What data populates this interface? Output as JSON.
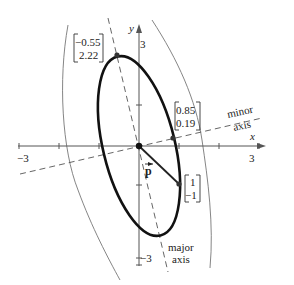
{
  "figure": {
    "type": "diagram",
    "axes": {
      "x_label": "x",
      "y_label": "y",
      "x_tick_min_label": "−3",
      "x_tick_max_label": "3",
      "y_tick_max_label": "3",
      "y_tick_min_label": "−3",
      "x_range": [
        -3,
        3
      ],
      "y_range": [
        -3,
        3
      ]
    },
    "vector": {
      "label": "p̅",
      "label_text": "p",
      "components": [
        "1",
        "−1"
      ]
    },
    "points": [
      {
        "name": "major-axis-point",
        "x": "−0.55",
        "y": "2.22"
      },
      {
        "name": "minor-axis-point",
        "x": "0.85",
        "y": "0.19"
      },
      {
        "name": "vector-endpoint",
        "x": "1",
        "y": "−1"
      }
    ],
    "labels": {
      "minor_line1": "minor",
      "minor_line2": "axis",
      "major_line1": "major",
      "major_line2": "axis"
    },
    "colors": {
      "ellipse": "#111111",
      "axes": "#555555",
      "level_curves": "#777777"
    }
  }
}
